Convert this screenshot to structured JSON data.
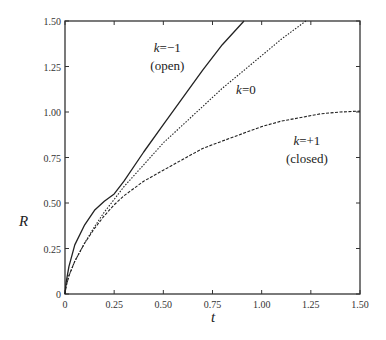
{
  "chart_data": {
    "type": "line",
    "title": "",
    "xlabel": "t",
    "ylabel": "R",
    "xlim": [
      0,
      1.5
    ],
    "ylim": [
      0,
      1.5
    ],
    "grid": false,
    "legend": "none (inline annotations)",
    "x_ticks": [
      "0",
      "0.25",
      "0.50",
      "0.75",
      "1.00",
      "1.25",
      "1.50"
    ],
    "y_ticks": [
      "0",
      "0.25",
      "0.50",
      "0.75",
      "1.00",
      "1.25",
      "1.50"
    ],
    "series": [
      {
        "name": "k=-1 (open)",
        "style": "solid",
        "x": [
          0,
          0.005,
          0.02,
          0.05,
          0.1,
          0.15,
          0.2,
          0.25,
          0.3,
          0.4,
          0.5,
          0.6,
          0.7,
          0.8,
          0.91
        ],
        "y": [
          0,
          0.06,
          0.15,
          0.27,
          0.38,
          0.46,
          0.51,
          0.55,
          0.62,
          0.78,
          0.93,
          1.08,
          1.23,
          1.37,
          1.5
        ]
      },
      {
        "name": "k=0",
        "style": "dotted",
        "x": [
          0,
          0.005,
          0.02,
          0.05,
          0.1,
          0.15,
          0.2,
          0.25,
          0.3,
          0.4,
          0.5,
          0.6,
          0.7,
          0.8,
          0.9,
          1.0,
          1.1,
          1.225
        ],
        "y": [
          0,
          0.04,
          0.1,
          0.18,
          0.28,
          0.37,
          0.45,
          0.52,
          0.59,
          0.71,
          0.83,
          0.93,
          1.03,
          1.13,
          1.22,
          1.31,
          1.4,
          1.5
        ]
      },
      {
        "name": "k=+1 (closed)",
        "style": "dashed",
        "x": [
          0,
          0.005,
          0.02,
          0.05,
          0.1,
          0.15,
          0.2,
          0.25,
          0.3,
          0.4,
          0.5,
          0.6,
          0.7,
          0.8,
          0.9,
          1.0,
          1.1,
          1.2,
          1.3,
          1.4,
          1.5
        ],
        "y": [
          0,
          0.04,
          0.1,
          0.18,
          0.28,
          0.36,
          0.43,
          0.49,
          0.54,
          0.62,
          0.68,
          0.74,
          0.8,
          0.84,
          0.88,
          0.92,
          0.95,
          0.97,
          0.99,
          1.0,
          1.005
        ]
      }
    ],
    "annotations": [
      {
        "text_var": "k",
        "text_rest": "=−1",
        "sub": "(open)",
        "x": 0.52,
        "y": 1.33
      },
      {
        "text_var": "k",
        "text_rest": "=0",
        "x": 0.92,
        "y": 1.1
      },
      {
        "text_var": "k",
        "text_rest": "=+1",
        "sub": "(closed)",
        "x": 1.23,
        "y": 0.82
      }
    ]
  }
}
